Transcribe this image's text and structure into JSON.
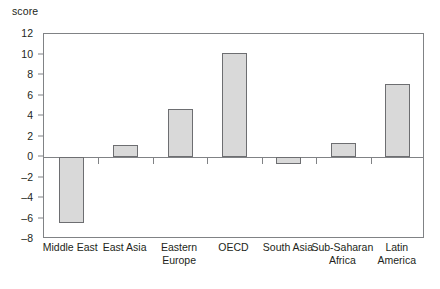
{
  "chart_data": {
    "type": "bar",
    "title": "",
    "subtitle": "",
    "xlabel": "",
    "ylabel": "score",
    "categories": [
      "Middle East",
      "East Asia",
      "Eastern Europe",
      "OECD",
      "South Asia",
      "Sub-Saharan Africa",
      "Latin America"
    ],
    "values": [
      -6.4,
      1.2,
      4.7,
      10.1,
      -0.7,
      1.4,
      7.1
    ],
    "ylim": [
      -8,
      12
    ],
    "ytick_labels": [
      "12",
      "10",
      "8",
      "6",
      "4",
      "2",
      "0",
      "–2",
      "–4",
      "–6",
      "–8"
    ],
    "ytick_values": [
      12,
      10,
      8,
      6,
      4,
      2,
      0,
      -2,
      -4,
      -6,
      -8
    ],
    "grid": false,
    "legend": false,
    "legend_position": "none",
    "bar_fill_color": "#d9d9d9",
    "bar_border_color": "#6d6e71",
    "axis_color": "#808285",
    "text_color": "#231f20"
  }
}
